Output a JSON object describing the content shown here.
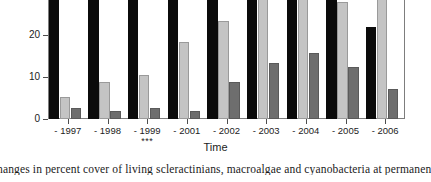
{
  "chart_data": {
    "type": "bar",
    "title": "",
    "xlabel": "Time",
    "ylabel": "",
    "ylim": [
      0,
      33
    ],
    "yticks": [
      0,
      10,
      20,
      30
    ],
    "ytick_labels": [
      "0",
      "10",
      "20",
      "30"
    ],
    "grid": false,
    "legend": "none",
    "categories": [
      "- 1997",
      "- 1998",
      "- 1999",
      "- 2001",
      "- 2002",
      "- 2003",
      "- 2004",
      "- 2005",
      "- 2006"
    ],
    "category_annotations": [
      "",
      "",
      "***",
      "",
      "",
      "",
      "",
      "",
      ""
    ],
    "series": [
      {
        "name": "living scleractinians",
        "color": "#0b0b0b",
        "values": [
          33,
          33,
          33,
          33,
          33,
          33,
          33,
          33,
          21.8
        ],
        "clipped": [
          true,
          true,
          true,
          true,
          true,
          true,
          true,
          true,
          false
        ]
      },
      {
        "name": "macroalgae",
        "color": "#c4c4c4",
        "values": [
          5.2,
          8.8,
          10.4,
          18.3,
          23.3,
          33,
          31.3,
          27.8,
          33
        ],
        "clipped": [
          false,
          false,
          false,
          false,
          false,
          true,
          false,
          false,
          true
        ]
      },
      {
        "name": "cyanobacteria",
        "color": "#6e6e6e",
        "values": [
          2.6,
          2.0,
          2.7,
          2.0,
          8.8,
          13.3,
          15.6,
          12.4,
          7.2
        ],
        "clipped": [
          false,
          false,
          false,
          false,
          false,
          false,
          false,
          false,
          false
        ]
      }
    ]
  },
  "axes": {
    "x_title": "Time"
  },
  "caption": {
    "text": "hanges in percent cover of living scleractinians, macroalgae and cyanobacteria at permanen"
  }
}
